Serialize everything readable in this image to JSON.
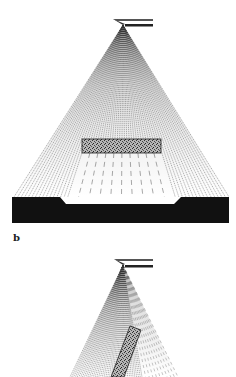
{
  "figure": {
    "width": 236,
    "height": 377,
    "colors": {
      "background": "#ffffff",
      "ink": "#111111",
      "ray": "#333333",
      "filter_fill": "#9a9a9a"
    },
    "panels": [
      {
        "id": "a",
        "label": "",
        "source": {
          "apex": [
            123,
            25
          ],
          "bar": [
            [
              113,
              19
            ],
            [
              153,
              19
            ],
            [
              153,
              27
            ],
            [
              125,
              27
            ]
          ]
        },
        "beam": {
          "left_base": [
            14,
            197
          ],
          "right_base": [
            229,
            197
          ]
        },
        "filter": {
          "x": 82,
          "y": 139,
          "w": 79,
          "h": 14
        },
        "object": {
          "outline": [
            [
              12,
              197
            ],
            [
              60,
              197
            ],
            [
              66,
              204
            ],
            [
              174,
              204
            ],
            [
              181,
              197
            ],
            [
              229,
              197
            ],
            [
              229,
              223
            ],
            [
              12,
              223
            ]
          ]
        }
      },
      {
        "id": "b",
        "label": "b",
        "label_pos": [
          13,
          233
        ],
        "source": {
          "apex": [
            123,
            265
          ],
          "bar": [
            [
              114,
              259
            ],
            [
              153,
              259
            ],
            [
              153,
              268
            ],
            [
              125,
              268
            ]
          ]
        },
        "beam": {
          "left_base": [
            70,
            377
          ],
          "right_base": [
            178,
            377
          ]
        },
        "filter": {
          "poly": [
            [
              130,
              326
            ],
            [
              141,
              330
            ],
            [
              124,
              377
            ],
            [
              111,
              377
            ]
          ]
        }
      }
    ]
  }
}
